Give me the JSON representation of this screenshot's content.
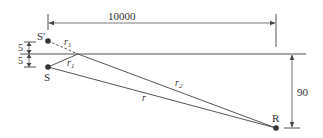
{
  "diagram": {
    "type": "geometric reflection diagram",
    "labels": {
      "distance_horizontal": "10000",
      "distance_vertical": "90",
      "offset_top": "5",
      "offset_bottom": "5",
      "source": "S",
      "image_source": "S'",
      "receiver": "R",
      "ray_image": "r",
      "ray_image_sub": "1",
      "ray_reflect": "r",
      "ray_reflect_sub": "1",
      "ray_reflected": "r",
      "ray_reflected_sub": "2",
      "ray_direct": "r"
    },
    "colors": {
      "line": "#555555",
      "point": "#333333",
      "text": "#333333"
    }
  }
}
